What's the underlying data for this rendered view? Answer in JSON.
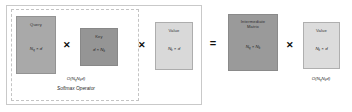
{
  "diagram": {
    "operators": {
      "multiply": "✕",
      "equals": "="
    },
    "matrices": [
      {
        "id": "query",
        "name": "Query",
        "dim_full": "N_q × d",
        "dim_base": "N",
        "dim_sub": "q",
        "dim_rest": " × d",
        "color": "#a9a9a9"
      },
      {
        "id": "key",
        "name": "Key",
        "dim_full": "d × N_k",
        "dim_base": "d × N",
        "dim_sub": "k",
        "dim_rest": "",
        "color": "#959595"
      },
      {
        "id": "value",
        "name": "Value",
        "dim_full": "N_k × d",
        "dim_base": "N",
        "dim_sub": "k",
        "dim_rest": " × d",
        "color": "#d9d9d9"
      },
      {
        "id": "intermediate",
        "name": "Intermediate Matrix",
        "name_line1": "Intermediate",
        "name_line2": "Matrix",
        "dim_full": "N_q × N_k",
        "dim_base": "N",
        "dim_sub": "q",
        "dim_rest": " × N",
        "dim_sub2": "k",
        "color": "#9a9a9a"
      },
      {
        "id": "value2",
        "name": "Value",
        "dim_full": "N_k × d",
        "dim_base": "N",
        "dim_sub": "k",
        "dim_rest": " × d",
        "color": "#dcdcdc"
      }
    ],
    "annotations": {
      "complexity_left_full": "O(N_q N_k d)",
      "complexity_left_pre": "O(N",
      "complexity_left_sub1": "q",
      "complexity_left_mid": "N",
      "complexity_left_sub2": "k",
      "complexity_left_post": "d)",
      "softmax_operator": "Softmax Operator",
      "complexity_right_full": "O(N_q N_k d)",
      "complexity_right_pre": "O(N",
      "complexity_right_sub1": "q",
      "complexity_right_mid": "N",
      "complexity_right_sub2": "k",
      "complexity_right_post": "d)"
    }
  }
}
